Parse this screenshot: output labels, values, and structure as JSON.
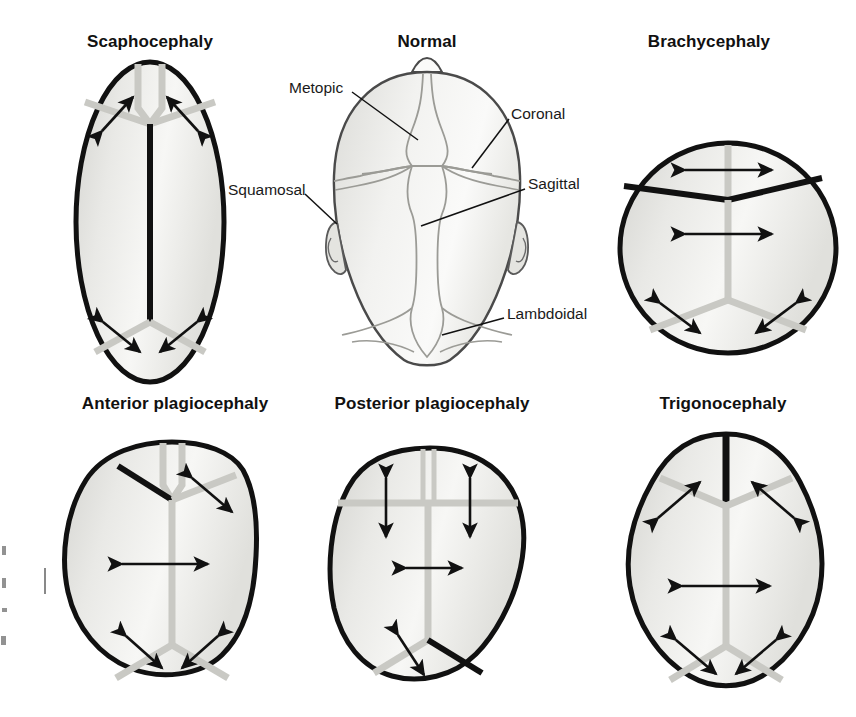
{
  "figure": {
    "background_color": "#ffffff",
    "ink_color": "#111111",
    "skull_fill_light": "#f2f2f0",
    "skull_fill_mid": "#d9d9d6",
    "suture_open_color": "#c9c9c4",
    "suture_fused_color": "#111111"
  },
  "panels": [
    {
      "id": "scaphocephaly",
      "title": "Scaphocephaly",
      "title_x": 150,
      "title_y": 43,
      "fused_suture": "sagittal",
      "shape": "narrow-elongated-oval"
    },
    {
      "id": "normal",
      "title": "Normal",
      "title_x": 427,
      "title_y": 43,
      "fused_suture": "none",
      "shape": "ovoid"
    },
    {
      "id": "brachycephaly",
      "title": "Brachycephaly",
      "title_x": 709,
      "title_y": 43,
      "fused_suture": "bilateral-coronal",
      "shape": "wide-round"
    },
    {
      "id": "anterior-plagiocephaly",
      "title": "Anterior plagiocephaly",
      "title_x": 175,
      "title_y": 405,
      "fused_suture": "unilateral-coronal-left",
      "shape": "asymmetric-anterior"
    },
    {
      "id": "posterior-plagiocephaly",
      "title": "Posterior plagiocephaly",
      "title_x": 432,
      "title_y": 405,
      "fused_suture": "unilateral-lambdoid-right",
      "shape": "asymmetric-posterior"
    },
    {
      "id": "trigonocephaly",
      "title": "Trigonocephaly",
      "title_x": 723,
      "title_y": 405,
      "fused_suture": "metopic",
      "shape": "triangular-keel"
    }
  ],
  "suture_callouts": [
    {
      "id": "metopic",
      "label": "Metopic",
      "label_x": 289,
      "label_y": 80,
      "line": [
        352,
        92,
        415,
        137
      ]
    },
    {
      "id": "coronal",
      "label": "Coronal",
      "label_x": 511,
      "label_y": 106,
      "line": [
        508,
        117,
        470,
        165
      ]
    },
    {
      "id": "squamosal",
      "label": "Squamosal",
      "label_x": 228,
      "label_y": 182,
      "line": [
        304,
        193,
        338,
        222
      ]
    },
    {
      "id": "sagittal",
      "label": "Sagittal",
      "label_x": 528,
      "label_y": 176,
      "line": [
        524,
        187,
        420,
        224
      ]
    },
    {
      "id": "lambdoidal",
      "label": "Lambdoidal",
      "label_x": 507,
      "label_y": 306,
      "line": [
        504,
        317,
        443,
        334
      ]
    }
  ]
}
